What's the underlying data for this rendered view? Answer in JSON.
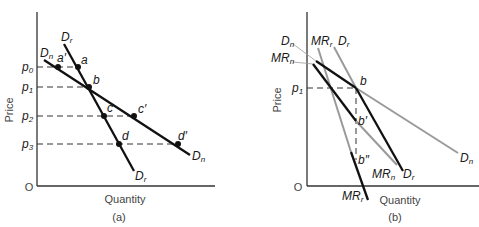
{
  "figure": {
    "panel_a": {
      "caption": "(a)",
      "x_label": "Quantity",
      "y_label": "Price",
      "origin_label": "O",
      "price_levels": [
        {
          "base": "p",
          "sub": "0"
        },
        {
          "base": "p",
          "sub": "1"
        },
        {
          "base": "p",
          "sub": "2"
        },
        {
          "base": "p",
          "sub": "3"
        }
      ],
      "curves": {
        "Dr_top": {
          "base": "D",
          "sub": "r"
        },
        "Dr_bottom": {
          "base": "D",
          "sub": "r"
        },
        "Dn_top": {
          "base": "D",
          "sub": "n"
        },
        "Dn_bottom": {
          "base": "D",
          "sub": "n"
        }
      },
      "points": {
        "a": "a",
        "a_prime": "a′",
        "b": "b",
        "c": "c",
        "c_prime": "c′",
        "d": "d",
        "d_prime": "d′"
      }
    },
    "panel_b": {
      "caption": "(b)",
      "x_label": "Quantity",
      "y_label": "Price",
      "origin_label": "O",
      "price_level": {
        "base": "p",
        "sub": "1"
      },
      "curves": {
        "Dn_top": {
          "base": "D",
          "sub": "n"
        },
        "MRn_top": {
          "base": "MR",
          "sub": "n"
        },
        "MRr_top": {
          "base": "MR",
          "sub": "r"
        },
        "Dr_top": {
          "base": "D",
          "sub": "r"
        },
        "Dn_bottom": {
          "base": "D",
          "sub": "n"
        },
        "MRn_bottom": {
          "base": "MR",
          "sub": "n"
        },
        "Dr_bottom": {
          "base": "D",
          "sub": "r"
        },
        "MRr_bottom": {
          "base": "MR",
          "sub": "r"
        }
      },
      "points": {
        "b": "b",
        "b_prime": "b′",
        "b_double_prime": "b″"
      }
    },
    "colors": {
      "ink": "#1a1a1a",
      "gray_line": "#9a9a9a",
      "axis": "#333333"
    }
  }
}
